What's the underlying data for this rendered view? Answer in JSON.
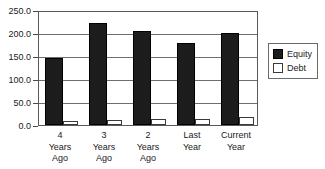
{
  "chart_data": {
    "type": "bar",
    "title": "",
    "subtitle": "",
    "xlabel": "",
    "ylabel": "",
    "ylim": [
      0,
      250
    ],
    "ytick_step": 50,
    "grid": true,
    "legend_position": "right",
    "categories": [
      "4 Years Ago",
      "3 Years Ago",
      "2 Years Ago",
      "Last Year",
      "Current Year"
    ],
    "category_lines": [
      [
        "4",
        "Years",
        "Ago"
      ],
      [
        "3",
        "Years",
        "Ago"
      ],
      [
        "2",
        "Years",
        "Ago"
      ],
      [
        "Last",
        "Year",
        ""
      ],
      [
        "Current",
        "Year",
        ""
      ]
    ],
    "ytick_labels": [
      "250.0",
      "200.0",
      "150.0",
      "100.0",
      "50.0",
      "0.0"
    ],
    "ytick_values": [
      250,
      200,
      150,
      100,
      50,
      0
    ],
    "series": [
      {
        "name": "Equity",
        "color": "#1c1c1c",
        "values": [
          145,
          222,
          205,
          178,
          200
        ]
      },
      {
        "name": "Debt",
        "color": "#ffffff",
        "values": [
          8,
          11,
          12,
          14,
          17
        ]
      }
    ]
  },
  "legend": {
    "items": [
      {
        "label": "Equity",
        "swatch": "equity"
      },
      {
        "label": "Debt",
        "swatch": "debt"
      }
    ]
  }
}
